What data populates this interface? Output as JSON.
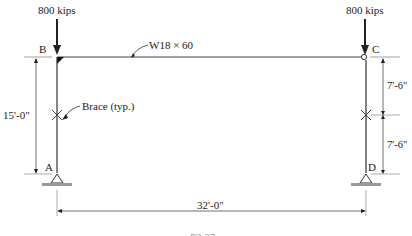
{
  "diagram": {
    "type": "portal frame",
    "loads": [
      {
        "node": "B",
        "label": "800 kips"
      },
      {
        "node": "C",
        "label": "800 kips"
      }
    ],
    "nodes": {
      "A": "A",
      "B": "B",
      "C": "C",
      "D": "D"
    },
    "beam": {
      "label": "W18 × 60"
    },
    "brace": {
      "label": "Brace (typ.)"
    },
    "dimensions": {
      "left_height": "15'-0\"",
      "right_upper": "7'-6\"",
      "right_lower": "7'-6\"",
      "span": "32'-0\""
    },
    "caption_partial": "P3.27",
    "colors": {
      "line": "#333333",
      "ground": "#9a9a9a"
    }
  }
}
